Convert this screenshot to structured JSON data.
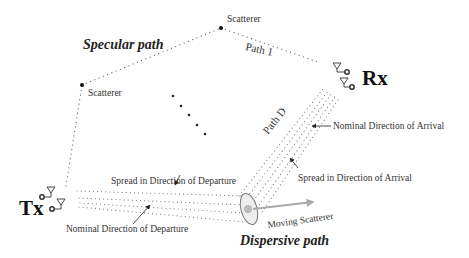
{
  "diagram": {
    "labels": {
      "specular_path": "Specular path",
      "scatterer_top": "Scatterer",
      "scatterer_left": "Scatterer",
      "path_1": "Path 1",
      "path_d": "Path D",
      "rx": "Rx",
      "tx": "Tx",
      "nominal_doa": "Nominal Direction of Arrival",
      "spread_doa": "Spread in Direction of Arrival",
      "spread_dod": "Spread in Direction of Departure",
      "nominal_dod": "Nominal Direction of Departure",
      "moving_scatterer": "Moving Scatterer",
      "dispersive_path": "Dispersive path"
    },
    "colors": {
      "text": "#333333",
      "dots": "#666666",
      "moving_scatterer_arrow": "#aaaaaa",
      "ellipse_fill": "#eeeeee"
    }
  }
}
